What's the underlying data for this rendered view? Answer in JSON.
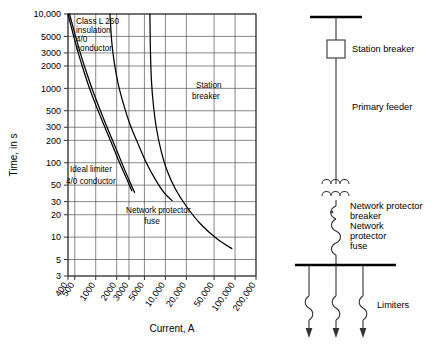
{
  "figure": {
    "kind": "time-current-coordination-curve-with-one-line-diagram"
  },
  "chart_data": {
    "type": "line",
    "title": "",
    "xlabel": "Current, A",
    "ylabel": "Time, in s",
    "xscale": "log",
    "yscale": "log",
    "xlim": [
      400,
      200000
    ],
    "ylim": [
      3,
      10000
    ],
    "grid": true,
    "legend": "inline-annotations",
    "xticks": [
      "400",
      "500",
      "1000",
      "2000",
      "3000",
      "5000",
      "10,000",
      "20,000",
      "50,000",
      "100,000",
      "200,000"
    ],
    "xtick_values": [
      400,
      500,
      1000,
      2000,
      3000,
      5000,
      10000,
      20000,
      50000,
      100000,
      200000
    ],
    "yticks": [
      "10,000",
      "5000",
      "3000",
      "2000",
      "1000",
      "500",
      "300",
      "200",
      "100",
      "50",
      "30",
      "20",
      "10",
      "5",
      "3"
    ],
    "ytick_values": [
      10000,
      5000,
      3000,
      2000,
      1000,
      500,
      300,
      200,
      100,
      50,
      30,
      20,
      10,
      5,
      3
    ],
    "series": [
      {
        "name": "Class L 260 insulation 4/0 conductor",
        "label": "Class L 260\ninsulation\n4/0\nconductor",
        "points": [
          [
            400,
            10000
          ],
          [
            460,
            6000
          ],
          [
            540,
            3400
          ],
          [
            640,
            2000
          ],
          [
            800,
            1050
          ],
          [
            1000,
            600
          ],
          [
            1300,
            330
          ],
          [
            1700,
            180
          ],
          [
            2200,
            100
          ],
          [
            2800,
            60
          ],
          [
            3300,
            42
          ]
        ]
      },
      {
        "name": "Ideal limiter 4/0 conductor",
        "label": "Ideal limiter\n4/0 conductor",
        "points": [
          [
            420,
            10000
          ],
          [
            500,
            5500
          ],
          [
            600,
            3000
          ],
          [
            720,
            1750
          ],
          [
            900,
            950
          ],
          [
            1150,
            520
          ],
          [
            1500,
            280
          ],
          [
            1950,
            155
          ],
          [
            2500,
            88
          ],
          [
            3100,
            55
          ],
          [
            3600,
            40
          ]
        ]
      },
      {
        "name": "Network protector fuse",
        "label": "Network protector\nfuse",
        "points": [
          [
            1600,
            10000
          ],
          [
            1700,
            4200
          ],
          [
            1850,
            2200
          ],
          [
            2100,
            1150
          ],
          [
            2500,
            620
          ],
          [
            3100,
            330
          ],
          [
            4000,
            185
          ],
          [
            5200,
            105
          ],
          [
            7000,
            62
          ],
          [
            9500,
            40
          ],
          [
            12500,
            31
          ]
        ]
      },
      {
        "name": "Station breaker",
        "label": "Station\nbreaker",
        "points": [
          [
            6000,
            10000
          ],
          [
            6100,
            3200
          ],
          [
            6300,
            1300
          ],
          [
            6700,
            620
          ],
          [
            7400,
            300
          ],
          [
            8600,
            150
          ],
          [
            10500,
            80
          ],
          [
            14000,
            44
          ],
          [
            20000,
            26
          ],
          [
            32000,
            15
          ],
          [
            55000,
            9.5
          ],
          [
            90000,
            7
          ]
        ]
      }
    ]
  },
  "annotations": [
    {
      "name": "class-l-label",
      "lines": [
        "Class L 260",
        "insulation",
        "4/0",
        "conductor"
      ]
    },
    {
      "name": "ideal-limiter-label",
      "lines": [
        "Ideal limiter",
        "4/0 conductor"
      ]
    },
    {
      "name": "network-protector-fuse-label",
      "lines": [
        "Network protector",
        "fuse"
      ]
    },
    {
      "name": "station-breaker-label",
      "lines": [
        "Station",
        "breaker"
      ]
    }
  ],
  "axis": {
    "x_title": "Current, A",
    "y_title": "Time, in s"
  },
  "one_line_diagram": {
    "labels": {
      "station_breaker": "Station breaker",
      "primary_feeder": "Primary feeder",
      "network_protector_breaker_l1": "Network protector",
      "network_protector_breaker_l2": "breaker",
      "network_protector_fuse_l1": "Network",
      "network_protector_fuse_l2": "protector",
      "network_protector_fuse_l3": "fuse",
      "limiters": "Limiters"
    }
  }
}
